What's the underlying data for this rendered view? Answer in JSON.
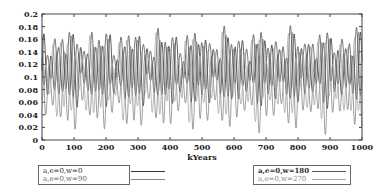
{
  "chart_data": {
    "type": "line",
    "title": "",
    "xlabel": "kYears",
    "ylabel": "",
    "xlim": [
      0,
      1000
    ],
    "ylim": [
      0,
      0.2
    ],
    "x_ticks": [
      "0",
      "100",
      "200",
      "300",
      "400",
      "500",
      "600",
      "700",
      "800",
      "900",
      "1000"
    ],
    "y_ticks": [
      "0",
      "0.02",
      "0.04",
      "0.06",
      "0.08",
      "0.1",
      "0.12",
      "0.14",
      "0.16",
      "0.18",
      "0.2"
    ],
    "grid": false,
    "legend_position": "below",
    "series": [
      {
        "name": "a,e=0,w=0",
        "color": "#333333",
        "phase_deg": 0,
        "mean": 0.11,
        "amp": 0.05
      },
      {
        "name": "a,e=0,w=90",
        "color": "#888888",
        "phase_deg": 90,
        "mean": 0.09,
        "amp": 0.07
      },
      {
        "name": "a,e=0,w=180",
        "color": "#555555",
        "phase_deg": 180,
        "mean": 0.12,
        "amp": 0.05
      },
      {
        "name": "a,e=0,w=270",
        "color": "#aaaaaa",
        "phase_deg": 270,
        "mean": 0.1,
        "amp": 0.06
      }
    ],
    "period_kyears": 23,
    "modulation_period_kyears": 100
  },
  "legend": {
    "left": [
      "a,e=0,w=0",
      "a,e=0,w=90"
    ],
    "right": [
      "a,e=0,w=180",
      "a,e=0,w=270"
    ]
  }
}
